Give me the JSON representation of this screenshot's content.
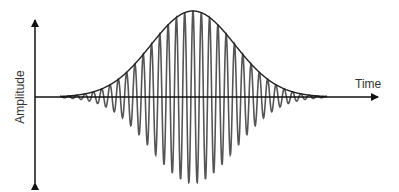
{
  "diagram": {
    "type": "wave-packet",
    "x_axis_label": "Time",
    "y_axis_label": "Amplitude",
    "colors": {
      "axis": "#111111",
      "wave": "#555555",
      "envelope": "#222222",
      "text": "#333333"
    },
    "geometry": {
      "axis_y": 97,
      "axis_x": 35,
      "x_axis_end": 378,
      "y_axis_top": 20,
      "y_axis_bottom": 183,
      "center_x": 193,
      "peak_amplitude": 86,
      "sigma": 42,
      "period": 8.3,
      "wave_start": 60,
      "wave_end": 327
    }
  }
}
